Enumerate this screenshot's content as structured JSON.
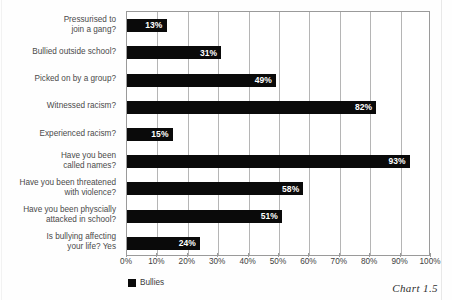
{
  "chart_data": {
    "type": "bar",
    "orientation": "horizontal",
    "title": "",
    "xlabel": "",
    "ylabel": "",
    "xlim": [
      0,
      100
    ],
    "xtick_labels": [
      "0%",
      "10%",
      "20%",
      "30%",
      "40%",
      "50%",
      "60%",
      "70%",
      "80%",
      "90%",
      "100%"
    ],
    "xtick_values": [
      0,
      10,
      20,
      30,
      40,
      50,
      60,
      70,
      80,
      90,
      100
    ],
    "grid": true,
    "grid_axis": "x",
    "legend": [
      "Bullies"
    ],
    "legend_position": "below-left",
    "series_color": "#0a0a0a",
    "categories": [
      "Pressurised to\njoin a gang?",
      "Bullied outside school?",
      "Picked on by a group?",
      "Witnessed racism?",
      "Experienced racism?",
      "Have you been\ncalled names?",
      "Have you been threatened\nwith violence?",
      "Have you been physcially\nattacked in school?",
      "Is bullying affecting\nyour life? Yes"
    ],
    "series": [
      {
        "name": "Bullies",
        "values": [
          13,
          31,
          49,
          82,
          15,
          93,
          58,
          51,
          24
        ],
        "data_labels": [
          "13%",
          "31%",
          "49%",
          "82%",
          "15%",
          "93%",
          "58%",
          "51%",
          "24%"
        ]
      }
    ]
  },
  "caption": "Chart 1.5",
  "legend": {
    "entries": [
      {
        "label": "Bullies",
        "color": "#0a0a0a"
      }
    ]
  }
}
